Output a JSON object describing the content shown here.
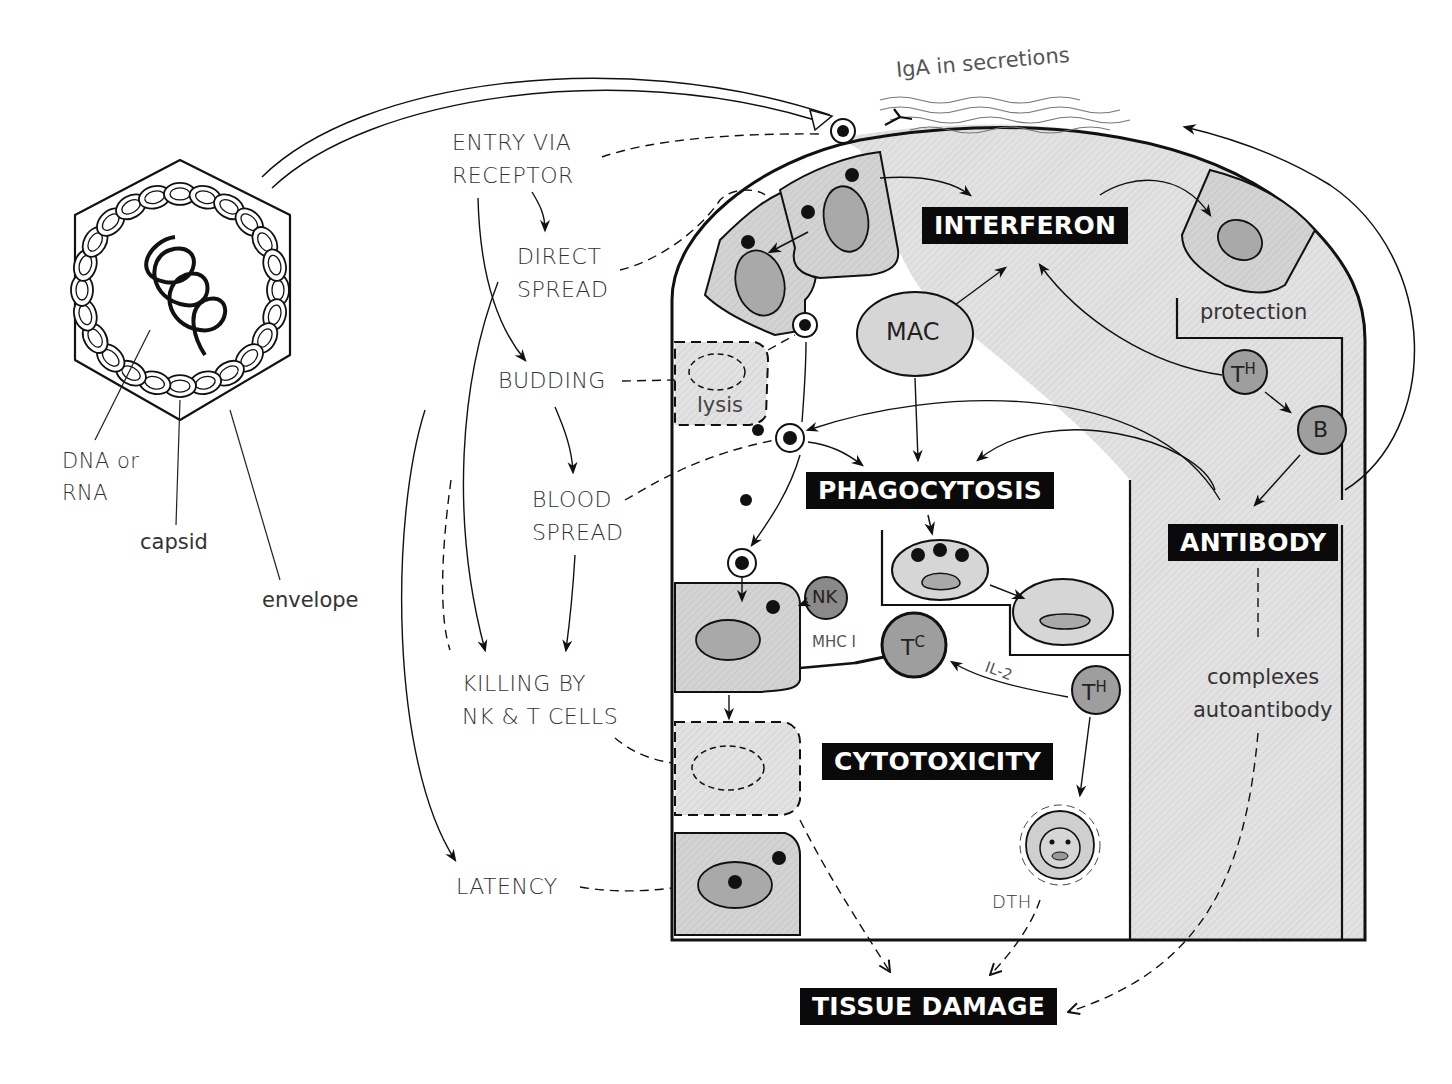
{
  "figure": {
    "virion": {
      "labels": {
        "nucleic_acid": "DNA or\nRNA",
        "nucleic_acid_line1": "DNA or",
        "nucleic_acid_line2": "RNA",
        "capsid": "capsid",
        "envelope": "envelope"
      }
    },
    "pathway_labels": {
      "entry_line1": "ENTRY VIA",
      "entry_line2": "RECEPTOR",
      "direct_line1": "DIRECT",
      "direct_line2": "SPREAD",
      "budding": "BUDDING",
      "blood_line1": "BLOOD",
      "blood_line2": "SPREAD",
      "killing_line1": "KILLING BY",
      "killing_line2": "NK & T CELLS",
      "latency": "LATENCY"
    },
    "top_label": "IgA in secretions",
    "mechanisms": {
      "interferon": "INTERFERON",
      "phagocytosis": "PHAGOCYTOSIS",
      "antibody": "ANTIBODY",
      "cytotoxicity": "CYTOTOXICITY",
      "tissue_damage": "TISSUE DAMAGE"
    },
    "cells": {
      "mac": "MAC",
      "th_top": "T",
      "th_top_sup": "H",
      "b": "B",
      "nk": "NK",
      "tc": "T",
      "tc_sup": "C",
      "th_bottom": "T",
      "th_bottom_sup": "H"
    },
    "annotations": {
      "lysis": "lysis",
      "protection": "protection",
      "mhc": "MHC I",
      "il2": "IL-2",
      "dth": "DTH",
      "complexes": "complexes",
      "autoantibody": "autoantibody"
    },
    "colors": {
      "cell_fill": "#d6d6d6",
      "nucleus_fill": "#a9a9a9",
      "lymphocyte_fill": "#9e9e9e",
      "shade": "#e9e9e9",
      "box": "#0a0a0a",
      "ink": "#111111"
    }
  }
}
